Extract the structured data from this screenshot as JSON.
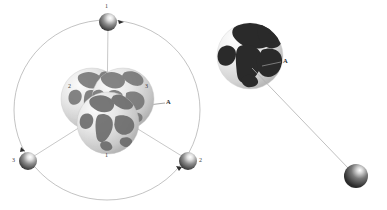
{
  "figure": {
    "background_color": "#ffffff",
    "line_color": "#9a9a9a",
    "label_color": "#3b3b3b",
    "globe_land_color": "#4a4a4a",
    "globe_ocean_color": "#d8d8d8",
    "sphere_color": "#5a5a5a"
  },
  "left_diagram": {
    "name": "orbit-constellation",
    "orbit": {
      "center_x": 107,
      "center_y": 110,
      "radius_x": 93,
      "radius_y": 90
    },
    "axis_label": "A",
    "satellites": [
      {
        "id": "satellite-1",
        "label": "1",
        "angle_deg": 90,
        "x": 108,
        "y": 22,
        "label_x": 106,
        "label_y": 6
      },
      {
        "id": "satellite-2",
        "label": "2",
        "angle_deg": 330,
        "x": 188,
        "y": 161,
        "label_x": 200,
        "label_y": 161
      },
      {
        "id": "satellite-3",
        "label": "3",
        "angle_deg": 210,
        "x": 28,
        "y": 161,
        "label_x": 13,
        "label_y": 161
      }
    ],
    "globes": [
      {
        "id": "globe-2",
        "label": "2",
        "cx": 92,
        "cy": 99,
        "r": 31,
        "label_x": 69,
        "label_y": 86
      },
      {
        "id": "globe-3",
        "label": "3",
        "cx": 123,
        "cy": 99,
        "r": 31,
        "label_x": 146,
        "label_y": 86
      },
      {
        "id": "globe-1",
        "label": "1",
        "cx": 108,
        "cy": 123,
        "r": 31,
        "label_x": 106,
        "label_y": 155
      }
    ],
    "axis_label_x": 167,
    "axis_label_y": 100
  },
  "right_diagram": {
    "name": "earth-satellite-pair",
    "globe": {
      "id": "earth-globe",
      "cx": 250,
      "cy": 56,
      "r": 33
    },
    "axis_label": "A",
    "axis_label_x": 282,
    "axis_label_y": 60,
    "satellite": {
      "id": "satellite-right",
      "x": 356,
      "y": 176,
      "r": 12
    },
    "tether_line": {
      "x1": 252,
      "y1": 68,
      "x2": 350,
      "y2": 170
    }
  }
}
